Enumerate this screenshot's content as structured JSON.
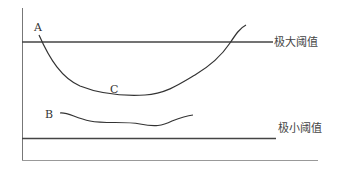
{
  "diagram": {
    "curves": {
      "A": "A",
      "B": "B",
      "C": "C"
    },
    "thresholds": {
      "upper": "极大阈值",
      "lower": "极小阈值"
    }
  }
}
